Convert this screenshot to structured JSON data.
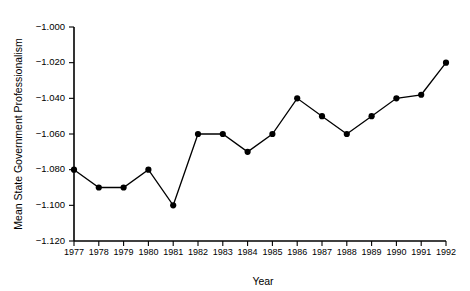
{
  "chart_data": {
    "type": "line",
    "title": "",
    "xlabel": "Year",
    "ylabel": "Mean State Government Professionalism",
    "categories": [
      1977,
      1978,
      1979,
      1980,
      1981,
      1982,
      1983,
      1984,
      1985,
      1986,
      1987,
      1988,
      1989,
      1990,
      1991,
      1992
    ],
    "x_tick_labels": [
      "1977",
      "1978",
      "1979",
      "1980",
      "1981",
      "1982",
      "1983",
      "1984",
      "1985",
      "1986",
      "1987",
      "1988",
      "1989",
      "1990",
      "1991",
      "1992"
    ],
    "values": [
      -1.08,
      -1.09,
      -1.09,
      -1.08,
      -1.1,
      -1.06,
      -1.06,
      -1.07,
      -1.06,
      -1.04,
      -1.05,
      -1.06,
      -1.05,
      -1.04,
      -1.038,
      -1.02
    ],
    "y_tick_labels": [
      "−1.000",
      "−1.020",
      "−1.040",
      "−1.060",
      "−1.080",
      "−1.100",
      "−1.120"
    ],
    "y_tick_values": [
      -1.0,
      -1.02,
      -1.04,
      -1.06,
      -1.08,
      -1.1,
      -1.12
    ],
    "ylim": [
      -1.12,
      -1.0
    ],
    "xlim": [
      1977,
      1992
    ],
    "grid": false,
    "legend": null,
    "marker": "filled-circle",
    "line_color": "#000000",
    "marker_color": "#000000",
    "background_color": "#ffffff"
  }
}
